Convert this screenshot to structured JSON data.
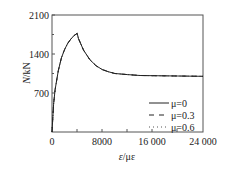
{
  "chart_data": {
    "type": "line",
    "title": "",
    "xlabel": "ε/με",
    "ylabel": "N/kN",
    "xlim": [
      0,
      24000
    ],
    "ylim": [
      0,
      2100
    ],
    "x_ticks": [
      "0",
      "8000",
      "16 000",
      "24 000"
    ],
    "y_ticks": [
      "0",
      "700",
      "1400",
      "2100"
    ],
    "grid": false,
    "legend_position": "lower right",
    "legend": [
      "μ=0",
      "μ=0.3",
      "μ=0.6"
    ],
    "series": [
      {
        "name": "μ=0",
        "style": "solid",
        "x": [
          0,
          250,
          500,
          1000,
          1500,
          2000,
          2500,
          3000,
          3500,
          4000,
          4200,
          5000,
          6000,
          7000,
          8000,
          9000,
          10000,
          12000,
          14000,
          16000,
          20000,
          24000
        ],
        "y": [
          0,
          500,
          760,
          1100,
          1330,
          1480,
          1590,
          1670,
          1730,
          1770,
          1680,
          1470,
          1300,
          1190,
          1120,
          1080,
          1050,
          1030,
          1015,
          1010,
          1005,
          1000
        ]
      },
      {
        "name": "μ=0.3",
        "style": "dashed",
        "x": [
          0,
          250,
          500,
          1000,
          1500,
          2000,
          2500,
          3000,
          3500,
          4000,
          4200,
          5000,
          6000,
          7000,
          8000,
          9000,
          10000,
          12000,
          14000,
          16000,
          20000,
          24000
        ],
        "y": [
          0,
          500,
          760,
          1100,
          1330,
          1480,
          1590,
          1670,
          1730,
          1770,
          1680,
          1470,
          1300,
          1190,
          1120,
          1080,
          1050,
          1030,
          1015,
          1010,
          1005,
          1000
        ]
      },
      {
        "name": "μ=0.6",
        "style": "dotted",
        "x": [
          0,
          250,
          500,
          1000,
          1500,
          2000,
          2500,
          3000,
          3500,
          4000,
          4200,
          5000,
          6000,
          7000,
          8000,
          9000,
          10000,
          12000,
          14000,
          16000,
          20000,
          24000
        ],
        "y": [
          0,
          500,
          760,
          1100,
          1330,
          1480,
          1590,
          1670,
          1730,
          1770,
          1680,
          1470,
          1300,
          1190,
          1120,
          1080,
          1050,
          1030,
          1015,
          1010,
          1005,
          1000
        ]
      }
    ]
  },
  "axes": {
    "x_label_main": "ε",
    "x_label_unit": "/με",
    "y_label_main": "N",
    "y_label_unit": "/kN"
  },
  "legend": {
    "items": [
      {
        "label": "μ=0"
      },
      {
        "label": "μ=0.3"
      },
      {
        "label": "μ=0.6"
      }
    ]
  }
}
